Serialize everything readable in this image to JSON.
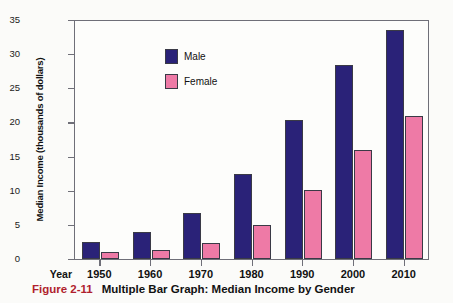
{
  "figure": {
    "number": "Figure 2-11",
    "title": "Multiple Bar Graph: Median Income by Gender"
  },
  "axes": {
    "x_axis_name": "Year",
    "y_axis_title": "Median Income (thousands of dollars)",
    "y_ticks": [
      "35",
      "30",
      "25",
      "20",
      "15",
      "10",
      "5",
      "0"
    ]
  },
  "legend": {
    "items": [
      {
        "label": "Male",
        "color": "#2a2278"
      },
      {
        "label": "Female",
        "color": "#ee7aa6"
      }
    ]
  },
  "chart_data": {
    "type": "bar",
    "title": "Multiple Bar Graph: Median Income by Gender",
    "xlabel": "Year",
    "ylabel": "Median Income (thousands of dollars)",
    "categories": [
      "1950",
      "1960",
      "1970",
      "1980",
      "1990",
      "2000",
      "2010"
    ],
    "series": [
      {
        "name": "Male",
        "color": "#2a2278",
        "values": [
          2.5,
          4.0,
          6.7,
          12.5,
          20.3,
          28.4,
          33.6
        ]
      },
      {
        "name": "Female",
        "color": "#ee7aa6",
        "values": [
          1.0,
          1.3,
          2.3,
          5.0,
          10.1,
          16.0,
          21.0
        ]
      }
    ],
    "ylim": [
      0,
      35
    ],
    "ytick_step": 5,
    "grid": false,
    "legend_position": "top-left"
  }
}
